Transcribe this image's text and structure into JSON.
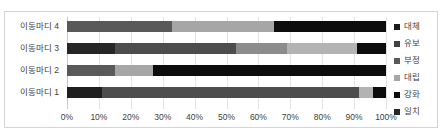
{
  "chart_data": {
    "type": "bar",
    "orientation": "horizontal",
    "stacked": true,
    "normalized": "100%",
    "title": "",
    "xlabel": "",
    "ylabel": "",
    "xlim": [
      0,
      100
    ],
    "grid": true,
    "legend_position": "right",
    "categories": [
      "이동마디 4",
      "이동마디 3",
      "이동마디 2",
      "이동마디 1"
    ],
    "tick_labels": [
      "0%",
      "10%",
      "20%",
      "30%",
      "40%",
      "50%",
      "60%",
      "70%",
      "80%",
      "90%",
      "100%"
    ],
    "tick_values": [
      0,
      10,
      20,
      30,
      40,
      50,
      60,
      70,
      80,
      90,
      100
    ],
    "series": [
      {
        "name": "대체",
        "color": "#1a1a1a",
        "values": [
          0,
          0,
          0,
          0
        ]
      },
      {
        "name": "유보",
        "color": "#404040",
        "values": [
          0,
          15,
          0,
          11
        ]
      },
      {
        "name": "부정",
        "color": "#595959",
        "values": [
          33,
          38,
          15,
          0
        ]
      },
      {
        "name": "대립",
        "color": "#a6a6a6",
        "values": [
          0,
          16,
          0,
          0
        ]
      },
      {
        "name": "강화",
        "color": "#0d0d0d",
        "values": [
          0,
          0,
          0,
          0
        ]
      },
      {
        "name": "일치",
        "color": "#262626",
        "values": [
          0,
          0,
          0,
          0
        ]
      }
    ],
    "bars": [
      {
        "category": "이동마디 4",
        "segments": [
          {
            "name": "부정",
            "value": 33,
            "color": "#595959"
          },
          {
            "name": "대립",
            "value": 32,
            "color": "#a6a6a6"
          },
          {
            "name": "대체",
            "value": 35,
            "color": "#0d0d0d"
          }
        ]
      },
      {
        "category": "이동마디 3",
        "segments": [
          {
            "name": "유보",
            "value": 15,
            "color": "#262626"
          },
          {
            "name": "부정",
            "value": 38,
            "color": "#4d4d4d"
          },
          {
            "name": "대립",
            "value": 16,
            "color": "#8c8c8c"
          },
          {
            "name": "강화",
            "value": 22,
            "color": "#b3b3b3"
          },
          {
            "name": "대체",
            "value": 9,
            "color": "#0d0d0d"
          }
        ]
      },
      {
        "category": "이동마디 2",
        "segments": [
          {
            "name": "부정",
            "value": 15,
            "color": "#595959"
          },
          {
            "name": "대립",
            "value": 12,
            "color": "#a6a6a6"
          },
          {
            "name": "대체",
            "value": 73,
            "color": "#0d0d0d"
          }
        ]
      },
      {
        "category": "이동마디 1",
        "segments": [
          {
            "name": "유보",
            "value": 11,
            "color": "#1f1f1f"
          },
          {
            "name": "부정",
            "value": 80.5,
            "color": "#4d4d4d"
          },
          {
            "name": "대립",
            "value": 4.5,
            "color": "#b3b3b3"
          },
          {
            "name": "대체",
            "value": 4,
            "color": "#0d0d0d"
          }
        ]
      }
    ],
    "legend": [
      {
        "label": "대체",
        "color": "#1a1a1a"
      },
      {
        "label": "유보",
        "color": "#404040"
      },
      {
        "label": "부정",
        "color": "#595959"
      },
      {
        "label": "대립",
        "color": "#a6a6a6"
      },
      {
        "label": "강화",
        "color": "#0d0d0d"
      },
      {
        "label": "일치",
        "color": "#262626"
      }
    ]
  }
}
